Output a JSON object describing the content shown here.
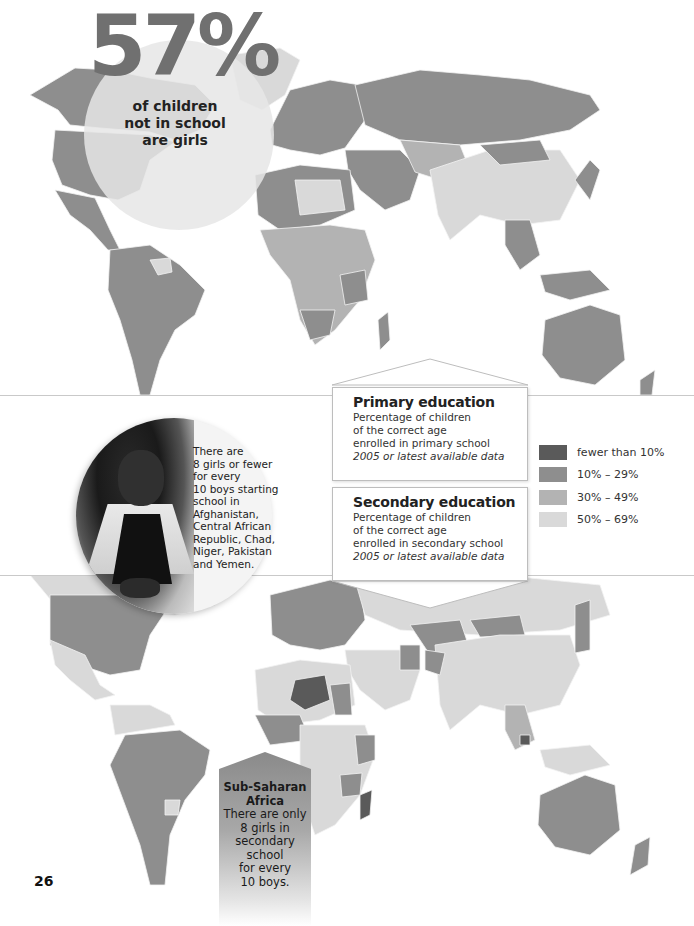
{
  "headline": {
    "stat": "57%",
    "caption_lines": [
      "of children",
      "not in school",
      "are girls"
    ]
  },
  "maps": {
    "top": {
      "subject": "Primary education"
    },
    "bottom": {
      "subject": "Secondary education"
    }
  },
  "callouts": {
    "primary": {
      "title": "Primary education",
      "lines": [
        "Percentage of children",
        "of the correct age",
        "enrolled in primary school"
      ],
      "note": "2005 or latest available data"
    },
    "secondary": {
      "title": "Secondary education",
      "lines": [
        "Percentage of children",
        "of the correct age",
        "enrolled in secondary school"
      ],
      "note": "2005 or latest available data"
    }
  },
  "legend": {
    "items": [
      {
        "label": "fewer than 10%",
        "color": "#5a5a5a"
      },
      {
        "label": "10% – 29%",
        "color": "#8e8e8e"
      },
      {
        "label": "30% – 49%",
        "color": "#b3b3b3"
      },
      {
        "label": "50% – 69%",
        "color": "#d9d9d9"
      }
    ]
  },
  "photo_callout": {
    "lines": [
      "There are",
      "8 girls or fewer",
      "for every",
      "10 boys starting",
      "school in",
      "Afghanistan,",
      "Central African",
      "Republic, Chad,",
      "Niger, Pakistan",
      "and Yemen."
    ]
  },
  "africa_callout": {
    "title_lines": [
      "Sub-Saharan",
      "Africa"
    ],
    "lines": [
      "There are only",
      "8 girls in",
      "secondary school",
      "for every",
      "10 boys."
    ]
  },
  "page_number": "26",
  "colors": {
    "level_lt10": "#5a5a5a",
    "level_10_29": "#8e8e8e",
    "level_30_49": "#b3b3b3",
    "level_50_69": "#d9d9d9",
    "stat_text": "#707070"
  }
}
